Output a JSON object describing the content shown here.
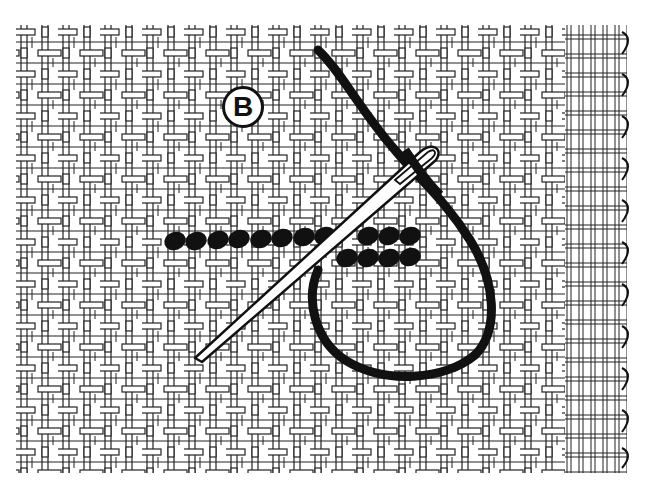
{
  "figure": {
    "label": "B",
    "colors": {
      "background": "#ffffff",
      "ink": "#111111",
      "canvas_thread": "#222222"
    },
    "elements": [
      {
        "name": "canvas",
        "description": "woven mesh canvas with selvage edge on right"
      },
      {
        "name": "stitch-row",
        "description": "row of filled oval stitches, lower offset row at right end"
      },
      {
        "name": "needle",
        "description": "needle with eye, threaded"
      },
      {
        "name": "thread",
        "description": "black thread forming a loop"
      }
    ],
    "stitches": {
      "top_row_count": 12,
      "bottom_row_count": 4
    }
  }
}
